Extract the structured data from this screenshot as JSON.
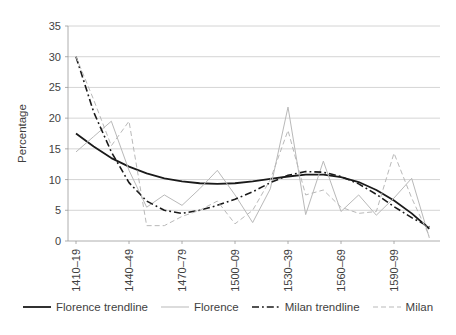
{
  "chart_data": {
    "type": "line",
    "title": "",
    "xlabel": "",
    "ylabel": "Percentage",
    "ylim": [
      0,
      35
    ],
    "yticks": [
      0,
      5,
      10,
      15,
      20,
      25,
      30,
      35
    ],
    "grid": "horizontal",
    "legend_position": "bottom",
    "categories": [
      "1410–19",
      "1420–29",
      "1430–39",
      "1440–49",
      "1450–59",
      "1460–69",
      "1470–79",
      "1480–89",
      "1490–99",
      "1500–09",
      "1510–19",
      "1520–29",
      "1530–39",
      "1540–49",
      "1550–59",
      "1560–69",
      "1570–79",
      "1580–89",
      "1590–99",
      "1600–09",
      "1610–19"
    ],
    "x_axis_labels_shown": [
      "1410–19",
      "1440–49",
      "1470–79",
      "1500–09",
      "1530–39",
      "1560–69",
      "1590–99"
    ],
    "x_label_every_n": 3,
    "series": [
      {
        "name": "Florence trendline",
        "style": "solid",
        "color": "#1a1a1a",
        "width": 1.8,
        "values": [
          17.5,
          15.4,
          13.5,
          12.1,
          11.0,
          10.2,
          9.7,
          9.4,
          9.3,
          9.4,
          9.7,
          10.1,
          10.5,
          10.8,
          10.8,
          10.4,
          9.6,
          8.3,
          6.6,
          4.5,
          2.0
        ]
      },
      {
        "name": "Florence",
        "style": "solid",
        "color": "#b9b9b9",
        "width": 1,
        "values": [
          14.5,
          17.0,
          19.5,
          11.5,
          5.5,
          7.5,
          5.8,
          8.5,
          11.5,
          7.5,
          3.0,
          8.5,
          21.8,
          4.3,
          13.0,
          4.8,
          7.5,
          4.2,
          7.0,
          10.2,
          0.5
        ]
      },
      {
        "name": "Milan trendline",
        "style": "dash-dot",
        "color": "#1a1a1a",
        "width": 1.6,
        "values": [
          30.0,
          21.0,
          14.5,
          9.5,
          6.5,
          5.0,
          4.5,
          5.0,
          5.8,
          6.8,
          8.0,
          9.5,
          10.7,
          11.3,
          11.2,
          10.5,
          9.3,
          7.6,
          5.6,
          3.8,
          2.3
        ]
      },
      {
        "name": "Milan",
        "style": "dashed",
        "color": "#b9b9b9",
        "width": 1,
        "values": [
          30.0,
          23.0,
          15.5,
          19.5,
          2.5,
          2.5,
          4.0,
          5.0,
          6.5,
          2.8,
          5.0,
          10.0,
          18.0,
          7.5,
          8.3,
          5.5,
          4.5,
          4.8,
          14.3,
          7.0,
          0.8
        ]
      }
    ],
    "colors": {
      "grid": "#c9c9c9",
      "axis": "#9a9a9a",
      "text": "#3f3f3f",
      "background": "#ffffff"
    }
  }
}
